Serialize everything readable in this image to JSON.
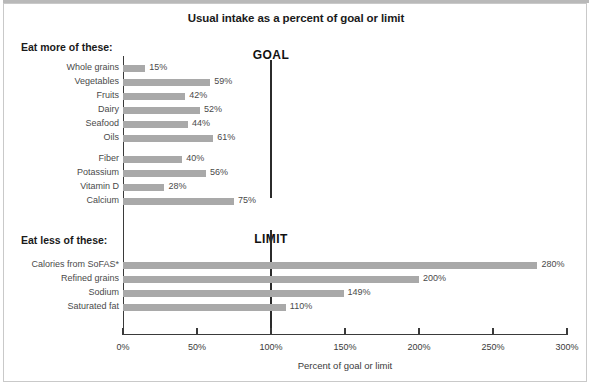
{
  "chart_data": {
    "type": "bar",
    "orientation": "horizontal",
    "title": "Usual intake as a percent of goal or limit",
    "xlabel": "Percent of goal or limit",
    "ylabel": "",
    "xlim": [
      0,
      300
    ],
    "xticks": [
      0,
      50,
      100,
      150,
      200,
      250,
      300
    ],
    "xticklabels": [
      "0%",
      "50%",
      "100%",
      "150%",
      "200%",
      "250%",
      "300%"
    ],
    "grid": false,
    "legend": null,
    "bar_color": "#a9a9a9",
    "reference_lines": [
      {
        "value": 100,
        "label": "GOAL",
        "section": "eat-more",
        "color": "#2b2b2b"
      },
      {
        "value": 100,
        "label": "LIMIT",
        "section": "eat-less",
        "color": "#2b2b2b"
      }
    ],
    "sections": [
      {
        "heading": "Eat more of these:",
        "groups": [
          {
            "categories": [
              "Whole grains",
              "Vegetables",
              "Fruits",
              "Dairy",
              "Seafood",
              "Oils"
            ],
            "values": [
              15,
              59,
              42,
              52,
              44,
              61
            ],
            "value_labels": [
              "15%",
              "59%",
              "42%",
              "52%",
              "44%",
              "61%"
            ]
          },
          {
            "categories": [
              "Fiber",
              "Potassium",
              "Vitamin D",
              "Calcium"
            ],
            "values": [
              40,
              56,
              28,
              75
            ],
            "value_labels": [
              "40%",
              "56%",
              "28%",
              "75%"
            ]
          }
        ]
      },
      {
        "heading": "Eat less of these:",
        "groups": [
          {
            "categories": [
              "Calories from SoFAS*",
              "Refined grains",
              "Sodium",
              "Saturated fat"
            ],
            "values": [
              280,
              200,
              149,
              110
            ],
            "value_labels": [
              "280%",
              "200%",
              "149%",
              "110%"
            ]
          }
        ]
      }
    ],
    "categories": [
      "Whole grains",
      "Vegetables",
      "Fruits",
      "Dairy",
      "Seafood",
      "Oils",
      "Fiber",
      "Potassium",
      "Vitamin D",
      "Calcium",
      "Calories from SoFAS*",
      "Refined grains",
      "Sodium",
      "Saturated fat"
    ],
    "values": [
      15,
      59,
      42,
      52,
      44,
      61,
      40,
      56,
      28,
      75,
      280,
      200,
      149,
      110
    ]
  }
}
